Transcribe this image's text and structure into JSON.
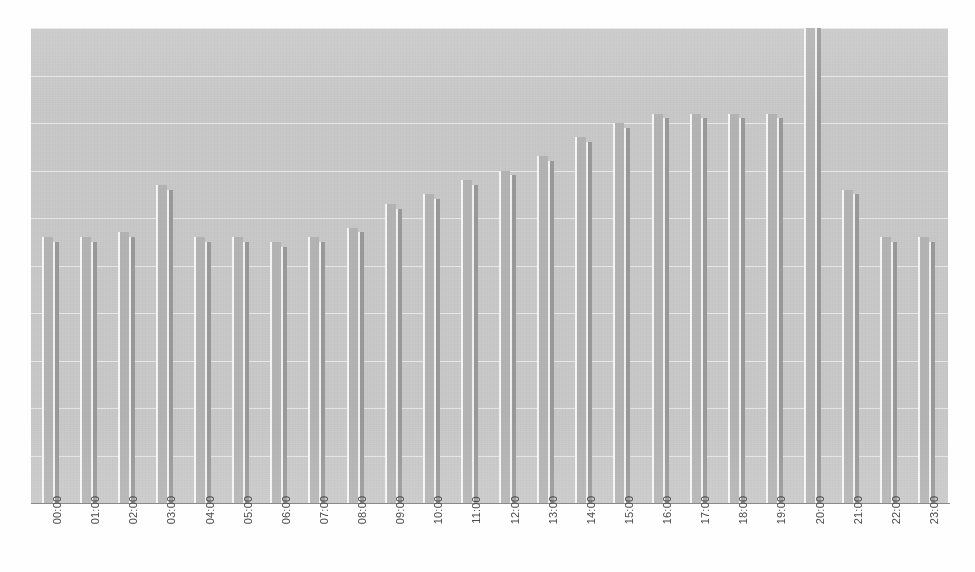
{
  "colors": {
    "plot_background": "#c9c9c9",
    "gridline": "#ededed",
    "bar_series_1": "#b4b4b4",
    "bar_series_2": "#9a9a9a",
    "axis_line": "#8a8a8a",
    "tick_label": "#4a4a4a",
    "page_background": "#fefefe"
  },
  "chart_data": {
    "type": "bar",
    "title": "",
    "subtitle": "",
    "xlabel": "",
    "ylabel": "",
    "grid": true,
    "grid_orientation": "horizontal",
    "gridline_count": 10,
    "legend_position": "none",
    "ylim": [
      0,
      100
    ],
    "categories": [
      "00:00",
      "01:00",
      "02:00",
      "03:00",
      "04:00",
      "05:00",
      "06:00",
      "07:00",
      "08:00",
      "09:00",
      "10:00",
      "11:00",
      "12:00",
      "13:00",
      "14:00",
      "15:00",
      "16:00",
      "17:00",
      "18:00",
      "19:00",
      "20:00",
      "21:00",
      "22:00",
      "23:00"
    ],
    "series": [
      {
        "name": "series-1",
        "color": "#b4b4b4",
        "values": [
          56,
          56,
          57,
          67,
          56,
          56,
          55,
          56,
          58,
          63,
          65,
          68,
          70,
          73,
          77,
          80,
          82,
          82,
          82,
          82,
          100,
          66,
          56,
          56
        ]
      },
      {
        "name": "series-2",
        "color": "#9a9a9a",
        "values": [
          55,
          55,
          56,
          66,
          55,
          55,
          54,
          55,
          57,
          62,
          64,
          67,
          69,
          72,
          76,
          79,
          81,
          81,
          81,
          81,
          100,
          65,
          55,
          55
        ]
      }
    ],
    "peak_category": "20:00",
    "peak_value": 100
  },
  "xaxis": {
    "tick_rotation_degrees": -90,
    "ticks": [
      "00:00",
      "01:00",
      "02:00",
      "03:00",
      "04:00",
      "05:00",
      "06:00",
      "07:00",
      "08:00",
      "09:00",
      "10:00",
      "11:00",
      "12:00",
      "13:00",
      "14:00",
      "15:00",
      "16:00",
      "17:00",
      "18:00",
      "19:00",
      "20:00",
      "21:00",
      "22:00",
      "23:00"
    ]
  }
}
